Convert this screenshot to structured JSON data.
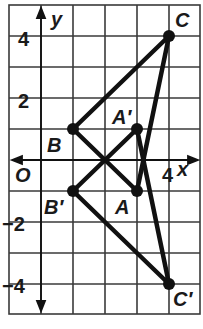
{
  "diagram": {
    "type": "coordinate-plane-reflection",
    "axes": {
      "x_label": "x",
      "y_label": "y",
      "origin_label": "O"
    },
    "tick_labels": {
      "y": [
        "4",
        "2",
        "−2",
        "−4"
      ],
      "x": [
        "4"
      ]
    },
    "points": {
      "A": {
        "label": "A",
        "coords": [
          3,
          -1
        ]
      },
      "B": {
        "label": "B",
        "coords": [
          1,
          1
        ]
      },
      "C": {
        "label": "C",
        "coords": [
          4,
          4
        ]
      },
      "A_prime": {
        "label": "A′",
        "coords": [
          3,
          1
        ]
      },
      "B_prime": {
        "label": "B′",
        "coords": [
          1,
          -1
        ]
      },
      "C_prime": {
        "label": "C′",
        "coords": [
          4,
          -4
        ]
      }
    },
    "triangles": [
      "ABC",
      "A′B′C′"
    ],
    "grid": {
      "x_range": [
        -1,
        5
      ],
      "y_range": [
        -5,
        5
      ]
    },
    "colors": {
      "line": "#111111",
      "grid": "#333333",
      "background": "#ffffff"
    }
  }
}
